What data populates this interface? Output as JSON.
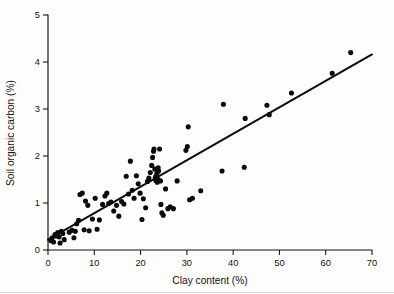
{
  "figure": {
    "name": "soil-organic-carbon-vs-clay-scatter",
    "background_color": "#fdfdfb",
    "point_color": "#0b0b0b",
    "line_color": "#0b0b0b",
    "axis_color": "#14110f"
  },
  "axes": {
    "x": {
      "label": "Clay content (%)",
      "min": 0,
      "max": 70,
      "tick_step": 10,
      "ticks": [
        0,
        10,
        20,
        30,
        40,
        50,
        60,
        70
      ],
      "tick_labels": [
        "0",
        "10",
        "20",
        "30",
        "40",
        "50",
        "60",
        "70"
      ]
    },
    "y": {
      "label": "Soil organic carbon (%)",
      "min": 0,
      "max": 5,
      "tick_step": 1,
      "ticks": [
        0,
        1,
        2,
        3,
        4,
        5
      ],
      "tick_labels": [
        "0",
        "1",
        "2",
        "3",
        "4",
        "5"
      ]
    }
  },
  "chart_data": {
    "type": "scatter",
    "title": "",
    "xlabel": "Clay content (%)",
    "ylabel": "Soil organic carbon (%)",
    "xlim": [
      0,
      70
    ],
    "ylim": [
      0,
      5
    ],
    "grid": false,
    "legend": false,
    "marker": "filled-circle",
    "marker_size_px": 4.6,
    "series": [
      {
        "name": "Soil samples",
        "points": [
          [
            0.6,
            0.2
          ],
          [
            0.9,
            0.26
          ],
          [
            1.2,
            0.17
          ],
          [
            1.5,
            0.33
          ],
          [
            1.8,
            0.3
          ],
          [
            2.1,
            0.37
          ],
          [
            2.4,
            0.28
          ],
          [
            2.6,
            0.15
          ],
          [
            2.9,
            0.4
          ],
          [
            3.2,
            0.35
          ],
          [
            3.5,
            0.22
          ],
          [
            4.6,
            0.38
          ],
          [
            5.2,
            0.42
          ],
          [
            5.6,
            0.26
          ],
          [
            5.9,
            0.4
          ],
          [
            6.2,
            0.56
          ],
          [
            6.6,
            0.63
          ],
          [
            6.9,
            1.18
          ],
          [
            7.4,
            1.21
          ],
          [
            7.8,
            0.43
          ],
          [
            8.1,
            1.04
          ],
          [
            8.6,
            0.95
          ],
          [
            8.9,
            0.41
          ],
          [
            9.6,
            0.66
          ],
          [
            10.2,
            1.1
          ],
          [
            10.6,
            0.44
          ],
          [
            11.1,
            0.64
          ],
          [
            11.8,
            0.97
          ],
          [
            12.3,
            1.15
          ],
          [
            12.7,
            1.21
          ],
          [
            13.1,
            0.99
          ],
          [
            13.6,
            1.02
          ],
          [
            14.2,
            0.83
          ],
          [
            14.8,
            0.95
          ],
          [
            15.3,
            0.72
          ],
          [
            15.9,
            1.03
          ],
          [
            16.4,
            0.98
          ],
          [
            16.9,
            1.57
          ],
          [
            17.4,
            1.19
          ],
          [
            17.8,
            1.89
          ],
          [
            18.2,
            1.27
          ],
          [
            18.6,
            1.1
          ],
          [
            19.1,
            1.58
          ],
          [
            19.5,
            1.41
          ],
          [
            19.9,
            1.21
          ],
          [
            20.3,
            0.65
          ],
          [
            20.6,
            1.09
          ],
          [
            21.1,
            0.9
          ],
          [
            21.5,
            1.46
          ],
          [
            21.8,
            1.53
          ],
          [
            22.1,
            1.65
          ],
          [
            22.4,
            1.8
          ],
          [
            22.6,
            1.97
          ],
          [
            22.8,
            2.1
          ],
          [
            22.9,
            2.15
          ],
          [
            23.1,
            1.72
          ],
          [
            23.2,
            1.55
          ],
          [
            23.3,
            1.48
          ],
          [
            23.4,
            1.5
          ],
          [
            23.5,
            1.62
          ],
          [
            23.6,
            1.44
          ],
          [
            23.7,
            1.51
          ],
          [
            23.8,
            1.75
          ],
          [
            23.9,
            1.68
          ],
          [
            24.1,
            2.15
          ],
          [
            24.3,
            1.47
          ],
          [
            24.4,
            0.97
          ],
          [
            24.6,
            0.79
          ],
          [
            24.9,
            0.74
          ],
          [
            25.4,
            1.3
          ],
          [
            25.9,
            0.88
          ],
          [
            26.4,
            0.92
          ],
          [
            27.1,
            0.88
          ],
          [
            27.9,
            1.47
          ],
          [
            29.8,
            2.12
          ],
          [
            30.1,
            2.2
          ],
          [
            30.3,
            2.62
          ],
          [
            30.6,
            1.07
          ],
          [
            31.2,
            1.1
          ],
          [
            33.0,
            1.26
          ],
          [
            37.6,
            1.68
          ],
          [
            37.9,
            3.1
          ],
          [
            42.4,
            1.76
          ],
          [
            42.6,
            2.8
          ],
          [
            47.3,
            3.08
          ],
          [
            47.8,
            2.88
          ],
          [
            52.6,
            3.34
          ],
          [
            61.4,
            3.76
          ],
          [
            65.4,
            4.2
          ]
        ]
      }
    ],
    "fit_line": {
      "name": "Linear regression",
      "type": "linear",
      "x_start": 0,
      "y_start": 0.22,
      "x_end": 70,
      "y_end": 4.16,
      "slope": 0.0563,
      "intercept": 0.22
    }
  }
}
